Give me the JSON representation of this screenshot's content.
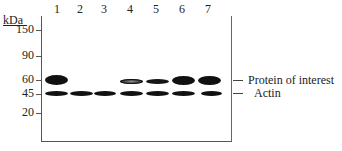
{
  "figure": {
    "type": "western-blot",
    "unit_label": "kDa",
    "lanes": [
      {
        "label": "1",
        "x": 57
      },
      {
        "label": "2",
        "x": 80
      },
      {
        "label": "3",
        "x": 104
      },
      {
        "label": "4",
        "x": 130
      },
      {
        "label": "5",
        "x": 156
      },
      {
        "label": "6",
        "x": 182
      },
      {
        "label": "7",
        "x": 208
      }
    ],
    "markers": [
      {
        "label": "150",
        "y": 30
      },
      {
        "label": "90",
        "y": 56
      },
      {
        "label": "60",
        "y": 80
      },
      {
        "label": "45",
        "y": 94
      },
      {
        "label": "20",
        "y": 113
      }
    ],
    "annotations": [
      {
        "label": "Protein of interest",
        "y": 80
      },
      {
        "label": "Actin",
        "y": 93
      }
    ],
    "bands": {
      "protein_of_interest": [
        {
          "lane": "1",
          "intensity": "strong",
          "x": 45,
          "y": 75,
          "w": 23,
          "h": 10
        },
        {
          "lane": "4",
          "intensity": "faint",
          "x": 120,
          "y": 79,
          "w": 23,
          "h": 5
        },
        {
          "lane": "5",
          "intensity": "moderate",
          "x": 146,
          "y": 79,
          "w": 23,
          "h": 5
        },
        {
          "lane": "6",
          "intensity": "strong",
          "x": 172,
          "y": 76,
          "w": 23,
          "h": 9
        },
        {
          "lane": "7",
          "intensity": "strong",
          "x": 198,
          "y": 76,
          "w": 23,
          "h": 9
        }
      ],
      "actin": [
        {
          "lane": "1",
          "x": 45,
          "y": 91,
          "w": 23,
          "h": 5
        },
        {
          "lane": "2",
          "x": 70,
          "y": 91,
          "w": 23,
          "h": 5
        },
        {
          "lane": "3",
          "x": 94,
          "y": 91,
          "w": 22,
          "h": 5
        },
        {
          "lane": "4",
          "x": 120,
          "y": 91,
          "w": 23,
          "h": 5
        },
        {
          "lane": "5",
          "x": 146,
          "y": 91,
          "w": 23,
          "h": 5
        },
        {
          "lane": "6",
          "x": 172,
          "y": 91,
          "w": 23,
          "h": 5
        },
        {
          "lane": "7",
          "x": 201,
          "y": 91,
          "w": 21,
          "h": 5
        }
      ]
    }
  }
}
